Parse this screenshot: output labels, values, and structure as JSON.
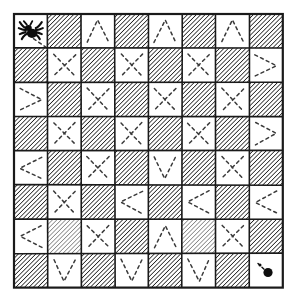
{
  "figure": {
    "background_color": "#ffffff",
    "ink_color": "#1a1a1a",
    "hatch_color": "#222222",
    "dash_color": "#3a3a3a"
  },
  "board": {
    "rows": 8,
    "cols": 8,
    "origin_x": 14,
    "origin_y": 14,
    "cell_w": 33.6,
    "cell_h": 34.2,
    "outer_border_width": 2.2,
    "cell_border_width": 1.6,
    "hatch_angle_deg": 45,
    "hatch_spacing": 3.1,
    "hatch_pattern_name": "diagonal-hatch",
    "fill_map": [
      [
        "white",
        "hatch",
        "white",
        "hatch",
        "white",
        "hatch",
        "white",
        "hatch"
      ],
      [
        "hatch",
        "white",
        "hatch",
        "white",
        "hatch",
        "white",
        "hatch",
        "white"
      ],
      [
        "white",
        "hatch",
        "white",
        "hatch",
        "white",
        "hatch",
        "white",
        "hatch"
      ],
      [
        "hatch",
        "white",
        "hatch",
        "white",
        "hatch",
        "white",
        "hatch",
        "white"
      ],
      [
        "white",
        "hatch",
        "white",
        "hatch",
        "white",
        "hatch",
        "white",
        "hatch"
      ],
      [
        "hatch",
        "white",
        "hatch",
        "white",
        "hatch",
        "white",
        "hatch",
        "white"
      ],
      [
        "white",
        "hatch-light",
        "white",
        "hatch",
        "white",
        "hatch-light",
        "white",
        "hatch"
      ],
      [
        "hatch",
        "white",
        "hatch",
        "white",
        "hatch",
        "white",
        "hatch",
        "white"
      ]
    ],
    "marks": [
      [
        "",
        "",
        "peak",
        "",
        "peak",
        "",
        "peak",
        ""
      ],
      [
        "",
        "cross",
        "",
        "cross",
        "",
        "cross",
        "",
        "right-half"
      ],
      [
        "right-half",
        "",
        "cross",
        "",
        "cross",
        "",
        "cross",
        ""
      ],
      [
        "",
        "cross",
        "",
        "cross",
        "",
        "cross",
        "",
        "right-half"
      ],
      [
        "left-half",
        "",
        "cross",
        "",
        "valley",
        "",
        "cross",
        ""
      ],
      [
        "",
        "cross",
        "",
        "left-half",
        "",
        "left-half",
        "",
        "left-half"
      ],
      [
        "left-half",
        "",
        "cross",
        "",
        "peak",
        "",
        "cross",
        ""
      ],
      [
        "",
        "valley",
        "",
        "valley",
        "",
        "valley",
        "",
        "dot"
      ]
    ],
    "mark_style": "dashed",
    "mark_dash_array": "3 3.4",
    "mark_stroke_width": 1.5
  },
  "tokens": {
    "spider": {
      "name": "spider",
      "row": 1,
      "col": 1,
      "color": "#0d0d0d",
      "label": "spider"
    },
    "fly": {
      "name": "fly",
      "row": 8,
      "col": 8,
      "color": "#0d0d0d",
      "radius": 4.6,
      "label": "fly"
    }
  }
}
